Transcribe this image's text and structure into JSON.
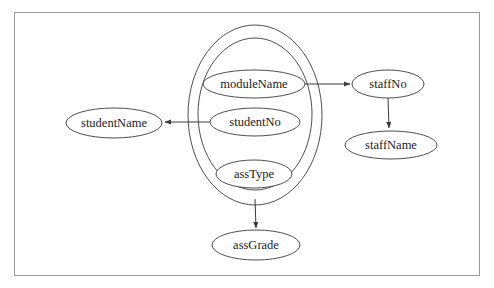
{
  "diagram": {
    "type": "functional-dependency",
    "background_color": "#ffffff",
    "border_color": "#9a9a9a",
    "stroke_color": "#3a3a3a",
    "text_color": "#1a1a1a",
    "nodes": [
      {
        "id": "studentName",
        "label": "studentName",
        "cx": 114,
        "cy": 123,
        "rx": 48,
        "ry": 15
      },
      {
        "id": "moduleName",
        "label": "moduleName",
        "cx": 254,
        "cy": 84,
        "rx": 51,
        "ry": 14
      },
      {
        "id": "studentNo",
        "label": "studentNo",
        "cx": 255,
        "cy": 122,
        "rx": 45,
        "ry": 14
      },
      {
        "id": "assType",
        "label": "assType",
        "cx": 254,
        "cy": 174,
        "rx": 38,
        "ry": 14
      },
      {
        "id": "assGrade",
        "label": "assGrade",
        "cx": 256,
        "cy": 245,
        "rx": 44,
        "ry": 15
      },
      {
        "id": "staffNo",
        "label": "staffNo",
        "cx": 388,
        "cy": 84,
        "rx": 36,
        "ry": 14
      },
      {
        "id": "staffName",
        "label": "staffName",
        "cx": 391,
        "cy": 145,
        "rx": 46,
        "ry": 14
      }
    ],
    "groups": [
      {
        "id": "outer-determinant-group",
        "cx": 255,
        "cy": 115,
        "rx": 67,
        "ry": 90
      },
      {
        "id": "inner-determinant-group",
        "cx": 255,
        "cy": 114,
        "rx": 57,
        "ry": 76
      }
    ],
    "edges": [
      {
        "id": "moduleName-to-staffNo",
        "from": "moduleName",
        "to": "staffNo",
        "x1": 305,
        "y1": 84,
        "x2": 350,
        "y2": 84
      },
      {
        "id": "studentNo-to-studentName",
        "from": "studentNo",
        "to": "studentName",
        "x1": 210,
        "y1": 122,
        "x2": 165,
        "y2": 122
      },
      {
        "id": "staffNo-to-staffName",
        "from": "staffNo",
        "to": "staffName",
        "x1": 388,
        "y1": 98,
        "x2": 389,
        "y2": 128
      },
      {
        "id": "determinant-to-assGrade",
        "from": "inner-determinant-group",
        "to": "assGrade",
        "x1": 255,
        "y1": 199,
        "x2": 256,
        "y2": 228
      }
    ]
  }
}
